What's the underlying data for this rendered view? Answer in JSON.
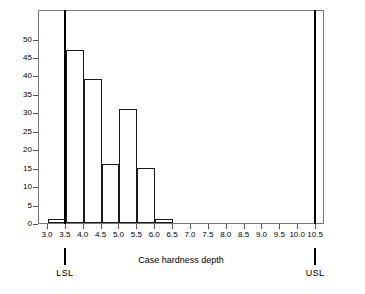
{
  "chart_data": {
    "type": "bar",
    "title": "",
    "xlabel": "Case hardness depth",
    "ylabel": "Frequency",
    "categories": [
      "3.0-3.5",
      "3.5-4.0",
      "4.0-4.5",
      "4.5-5.0",
      "5.0-5.5",
      "5.5-6.0",
      "6.0-6.5"
    ],
    "bin_edges": [
      3.0,
      3.5,
      4.0,
      4.5,
      5.0,
      5.5,
      6.0,
      6.5
    ],
    "values": [
      1,
      47,
      39,
      16,
      31,
      15,
      1
    ],
    "xlim": [
      2.75,
      10.75
    ],
    "ylim": [
      0,
      58
    ],
    "xticks": [
      3.0,
      3.5,
      4.0,
      4.5,
      5.0,
      5.5,
      6.0,
      6.5,
      7.0,
      7.5,
      8.0,
      8.5,
      9.0,
      9.5,
      10.0,
      10.5
    ],
    "xtick_labels": [
      "3.0",
      "3.5",
      "4.0",
      "4.5",
      "5.0",
      "5.5",
      "6.0",
      "6.5",
      "7.0",
      "7.5",
      "8.0",
      "8.5",
      "9.0",
      "9.5",
      "10.0",
      "10.5"
    ],
    "yticks": [
      0,
      5,
      10,
      15,
      20,
      25,
      30,
      35,
      40,
      45,
      50
    ],
    "ytick_labels": [
      "0",
      "5",
      "10",
      "15",
      "20",
      "25",
      "30",
      "35",
      "40",
      "45",
      "50"
    ],
    "grid": false,
    "legend": "none",
    "bar_edge_color": "#1a1a1a",
    "bar_fill_color": "transparent",
    "frame_color": "#777777",
    "spec_limits": [
      {
        "name": "LSL",
        "label": "LSL",
        "value": 3.5,
        "color": "#000000"
      },
      {
        "name": "USL",
        "label": "USL",
        "value": 10.5,
        "color": "#000000"
      }
    ]
  }
}
